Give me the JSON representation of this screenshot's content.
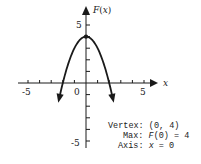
{
  "chart_data": {
    "type": "line",
    "title": "",
    "function": "F(x) = -x^2 + 4",
    "xlabel": "x",
    "ylabel": "F(x)",
    "xlim": [
      -5.5,
      5.5
    ],
    "ylim": [
      -5.5,
      5.5
    ],
    "x_ticks": [
      -5,
      -4,
      -3,
      -2,
      -1,
      1,
      2,
      3,
      4,
      5
    ],
    "y_ticks": [
      -5,
      -4,
      -3,
      -2,
      -1,
      1,
      2,
      3,
      4,
      5
    ],
    "x_tick_labels": [
      "-5",
      "0",
      "5"
    ],
    "y_tick_labels": [
      "5",
      "-5"
    ],
    "grid": false,
    "series": [
      {
        "name": "F(x)",
        "x": [
          -2.3,
          -2,
          -1.5,
          -1,
          -0.5,
          0,
          0.5,
          1,
          1.5,
          2,
          2.3
        ],
        "values": [
          -1.29,
          0,
          1.75,
          3,
          3.75,
          4,
          3.75,
          3,
          1.75,
          0,
          -1.29
        ]
      }
    ],
    "points": [
      {
        "label": "vertex",
        "x": 0,
        "y": 4
      }
    ],
    "annotations": {
      "vertex": "Vertex: (0, 4)",
      "max": "Max: F(0) = 4",
      "axis": "Axis: x = 0"
    }
  },
  "labels": {
    "y_axis": "F(x)",
    "x_axis": "x",
    "x_neg5": "-5",
    "x_zero": "0",
    "x_pos5": "5",
    "y_pos5": "5",
    "y_neg5": "-5",
    "vertex_prefix": "Vertex:",
    "vertex_value": "(0, 4)",
    "max_prefix": "Max:",
    "max_value": "F(0) = 4",
    "axis_prefix": "Axis:",
    "axis_value": "x = 0"
  },
  "colors": {
    "ink": "#1a1a1a",
    "background": "#ffffff"
  }
}
